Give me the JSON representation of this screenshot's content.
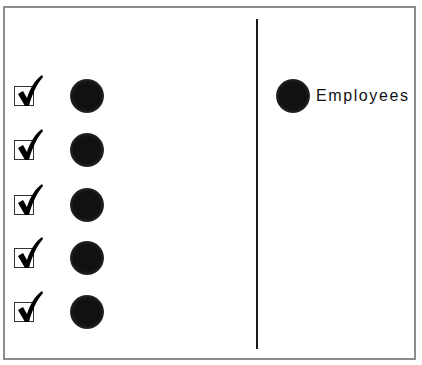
{
  "caption": {
    "text": "",
    "clipped": true
  },
  "left_panel": {
    "rows": [
      {
        "checked": true,
        "checkbox_icon": "checkbox-checked-icon",
        "marker_icon": "filled-circle-icon"
      },
      {
        "checked": true,
        "checkbox_icon": "checkbox-checked-icon",
        "marker_icon": "filled-circle-icon"
      },
      {
        "checked": true,
        "checkbox_icon": "checkbox-checked-icon",
        "marker_icon": "filled-circle-icon"
      },
      {
        "checked": true,
        "checkbox_icon": "checkbox-checked-icon",
        "marker_icon": "filled-circle-icon"
      },
      {
        "checked": true,
        "checkbox_icon": "checkbox-checked-icon",
        "marker_icon": "filled-circle-icon"
      }
    ]
  },
  "right_panel": {
    "legend": {
      "marker_icon": "filled-circle-icon",
      "label": "Employees"
    }
  },
  "colors": {
    "frame": "#8c8c8c",
    "divider": "#1a1a1a",
    "marker": "#111111",
    "check": "#000000"
  }
}
